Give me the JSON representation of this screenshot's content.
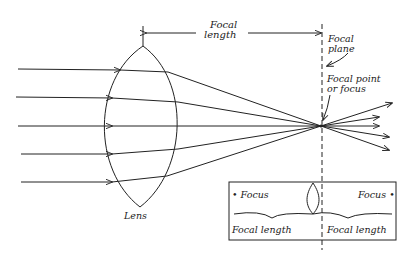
{
  "diagram": {
    "type": "converging-lens-ray-diagram",
    "labels": {
      "focal_length_top_line1": "Focal",
      "focal_length_top_line2": "length",
      "focal_plane_line1": "Focal",
      "focal_plane_line2": "plane",
      "focal_point_line1": "Focal point",
      "focal_point_line2": "or focus",
      "lens": "Lens"
    },
    "inset": {
      "focus_left": "• Focus",
      "focus_right": "Focus •",
      "focal_length_left": "Focal length",
      "focal_length_right": "Focal length"
    },
    "rays": {
      "count": 5,
      "converge_at": "focal point"
    },
    "colors": {
      "ink": "#222222",
      "background": "#ffffff"
    }
  }
}
